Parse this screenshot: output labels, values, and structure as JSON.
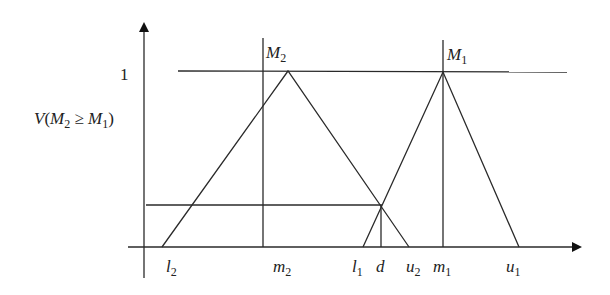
{
  "figure": {
    "type": "fuzzy-number-comparison-diagram",
    "y_axis": {
      "tick_label_one": "1",
      "label": {
        "prefix": "V(",
        "a": "M",
        "a_sub": "2",
        "op": " ≥ ",
        "b": "M",
        "b_sub": "1",
        "suffix": ")"
      }
    },
    "peaks": [
      {
        "name": "M",
        "sub": "2"
      },
      {
        "name": "M",
        "sub": "1"
      }
    ],
    "x_labels": [
      {
        "name": "l",
        "sub": "2"
      },
      {
        "name": "m",
        "sub": "2"
      },
      {
        "name": "l",
        "sub": "1"
      },
      {
        "name": "d",
        "sub": ""
      },
      {
        "name": "u",
        "sub": "2"
      },
      {
        "name": "m",
        "sub": "1"
      },
      {
        "name": "u",
        "sub": "1"
      }
    ]
  }
}
